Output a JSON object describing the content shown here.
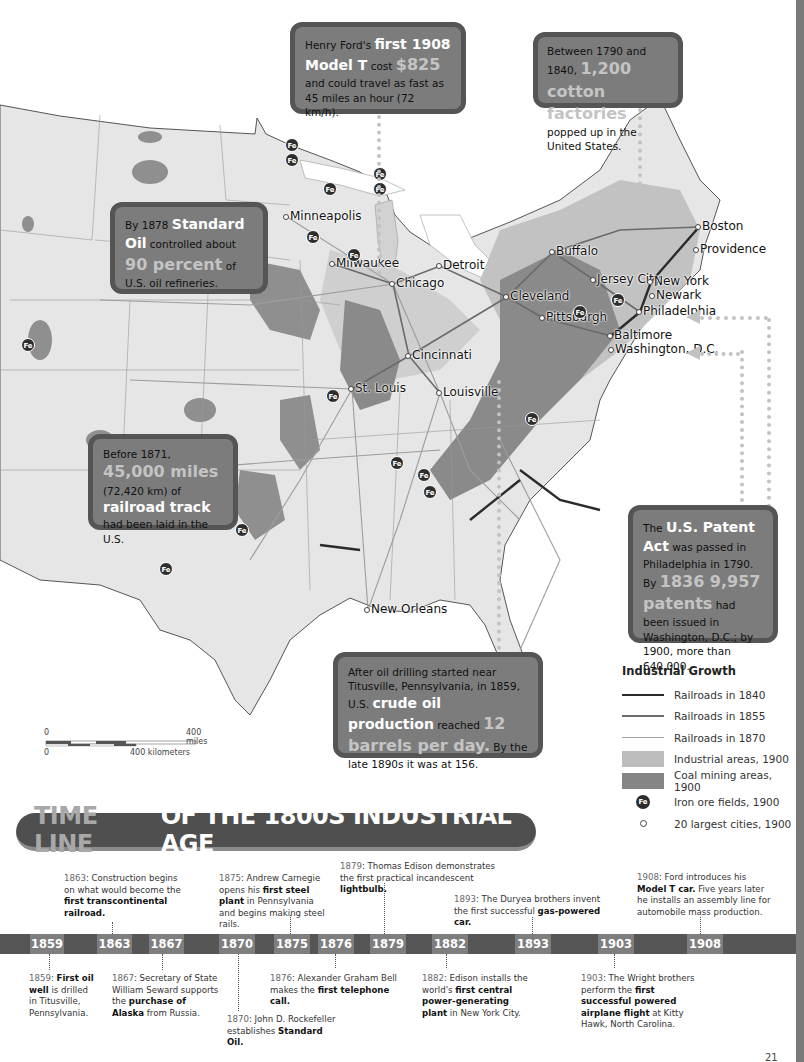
{
  "map": {
    "cities": [
      {
        "name": "Minneapolis",
        "x": 287,
        "y": 217
      },
      {
        "name": "Milwaukee",
        "x": 333,
        "y": 264
      },
      {
        "name": "Chicago",
        "x": 393,
        "y": 284
      },
      {
        "name": "Detroit",
        "x": 440,
        "y": 266
      },
      {
        "name": "Cleveland",
        "x": 507,
        "y": 297
      },
      {
        "name": "Pittsburgh",
        "x": 543,
        "y": 318
      },
      {
        "name": "Buffalo",
        "x": 553,
        "y": 252
      },
      {
        "name": "Boston",
        "x": 699,
        "y": 227
      },
      {
        "name": "Providence",
        "x": 697,
        "y": 250
      },
      {
        "name": "Jersey City",
        "x": 594,
        "y": 280
      },
      {
        "name": "New York",
        "x": 651,
        "y": 282
      },
      {
        "name": "Newark",
        "x": 653,
        "y": 296
      },
      {
        "name": "Philadelphia",
        "x": 640,
        "y": 312
      },
      {
        "name": "Baltimore",
        "x": 611,
        "y": 336
      },
      {
        "name": "Washington, D.C.",
        "x": 612,
        "y": 350
      },
      {
        "name": "Cincinnati",
        "x": 409,
        "y": 356
      },
      {
        "name": "St. Louis",
        "x": 352,
        "y": 389
      },
      {
        "name": "Louisville",
        "x": 440,
        "y": 393
      },
      {
        "name": "New Orleans",
        "x": 368,
        "y": 610
      }
    ],
    "iron_ore_markers": [
      {
        "x": 292,
        "y": 145
      },
      {
        "x": 292,
        "y": 160
      },
      {
        "x": 380,
        "y": 174
      },
      {
        "x": 380,
        "y": 189
      },
      {
        "x": 330,
        "y": 189
      },
      {
        "x": 313,
        "y": 237
      },
      {
        "x": 354,
        "y": 255
      },
      {
        "x": 333,
        "y": 396
      },
      {
        "x": 28,
        "y": 345
      },
      {
        "x": 397,
        "y": 463
      },
      {
        "x": 424,
        "y": 475
      },
      {
        "x": 430,
        "y": 492
      },
      {
        "x": 532,
        "y": 419
      },
      {
        "x": 242,
        "y": 530
      },
      {
        "x": 166,
        "y": 569
      },
      {
        "x": 618,
        "y": 300
      },
      {
        "x": 580,
        "y": 312
      }
    ],
    "fe_label": "Fe"
  },
  "callouts": {
    "ford": {
      "pre": "Henry Ford's ",
      "highlight1": "first 1908 Model T",
      "mid": " cost ",
      "highlight2": "$825",
      "post": " and could travel as fast as 45 miles an hour (72 km/h)."
    },
    "cotton": {
      "pre": "Between 1790 and 1840, ",
      "highlight": "1,200 cotton factories",
      "post": " popped up in the United States."
    },
    "standard_oil": {
      "pre": "By 1878 ",
      "highlight1": "Standard Oil",
      "mid": " controlled about ",
      "highlight2": "90 percent",
      "post": " of U.S. oil refineries."
    },
    "railroad": {
      "pre": "Before 1871, ",
      "highlight1": "45,000 miles",
      "mid": " (72,420 km) of ",
      "highlight2": "railroad track",
      "post": " had been laid in the U.S."
    },
    "patent": {
      "pre": "The ",
      "highlight1": "U.S. Patent Act",
      "mid": " was passed in Philadelphia in 1790. By ",
      "highlight2": "1836 9,957 patents",
      "post": " had been issued in Washington, D.C.; by 1900, more than 640,000."
    },
    "oil": {
      "pre": "After oil drilling started near Titusville, Pennsylvania, in 1859, U.S. ",
      "highlight1": "crude oil production",
      "mid": " reached ",
      "highlight2": "12 barrels per day.",
      "post": " By the late 1890s it was at 156."
    }
  },
  "legend": {
    "title": "Industrial Growth",
    "items": [
      {
        "label": "Railroads in 1840",
        "type": "line",
        "color": "#2b2b2b",
        "width": 2.5
      },
      {
        "label": "Railroads in 1855",
        "type": "line",
        "color": "#6d6d6d",
        "width": 1.8
      },
      {
        "label": "Railroads in 1870",
        "type": "line",
        "color": "#a3a3a3",
        "width": 1.2
      },
      {
        "label": "Industrial areas, 1900",
        "type": "area",
        "color": "#bdbdbd"
      },
      {
        "label": "Coal mining areas, 1900",
        "type": "area",
        "color": "#858585"
      },
      {
        "label": "Iron ore fields, 1900",
        "type": "fe"
      },
      {
        "label": "20 largest cities, 1900",
        "type": "city"
      }
    ]
  },
  "scale_bar": {
    "miles_zero": "0",
    "miles_label": "400 miles",
    "km_zero": "0",
    "km_label": "400 kilometers"
  },
  "timeline": {
    "title_part1": "TIME LINE",
    "title_part2": "OF THE 1800S INDUSTRIAL AGE",
    "years": [
      {
        "label": "1859",
        "x": 30,
        "w": 34
      },
      {
        "label": "1863",
        "x": 97,
        "w": 35
      },
      {
        "label": "1867",
        "x": 149,
        "w": 35
      },
      {
        "label": "1870",
        "x": 219,
        "w": 36
      },
      {
        "label": "1875",
        "x": 274,
        "w": 36
      },
      {
        "label": "1876",
        "x": 318,
        "w": 36
      },
      {
        "label": "1879",
        "x": 370,
        "w": 36
      },
      {
        "label": "1882",
        "x": 432,
        "w": 36
      },
      {
        "label": "1893",
        "x": 515,
        "w": 36
      },
      {
        "label": "1903",
        "x": 598,
        "w": 36
      },
      {
        "label": "1908",
        "x": 687,
        "w": 36
      }
    ],
    "events_above": [
      {
        "year": "1863",
        "pre": "Construction begins on what would become the ",
        "bold": "first transcontinental railroad.",
        "post": ""
      },
      {
        "year": "1875",
        "pre": "Andrew Carnegie opens his ",
        "bold": "first steel plant",
        "post": " in Pennsylvania and begins making steel rails."
      },
      {
        "year": "1879",
        "pre": "Thomas Edison demonstrates the first practical incandescent ",
        "bold": "lightbulb.",
        "post": ""
      },
      {
        "year": "1893",
        "pre": "The Duryea brothers invent the first successful ",
        "bold": "gas-powered car.",
        "post": ""
      },
      {
        "year": "1908",
        "pre": "Ford introduces his ",
        "bold": "Model T car.",
        "post": " Five years later he installs an assembly line for automobile mass production."
      }
    ],
    "events_below": [
      {
        "year": "1859",
        "pre": "",
        "bold": "First oil well",
        "post": " is drilled in Titusville, Pennsylvania."
      },
      {
        "year": "1867",
        "pre": "Secretary of State William Seward supports the ",
        "bold": "purchase of Alaska",
        "post": " from Russia."
      },
      {
        "year": "1870",
        "pre": "John D. Rockefeller establishes ",
        "bold": "Standard Oil.",
        "post": ""
      },
      {
        "year": "1876",
        "pre": "Alexander Graham Bell makes the ",
        "bold": "first telephone call.",
        "post": ""
      },
      {
        "year": "1882",
        "pre": "Edison installs the world's ",
        "bold": "first central power-generating plant",
        "post": " in New York City."
      },
      {
        "year": "1903",
        "pre": "The Wright brothers perform the ",
        "bold": "first successful powered airplane flight",
        "post": " at Kitty Hawk, North Carolina."
      }
    ]
  },
  "page_number": "21"
}
